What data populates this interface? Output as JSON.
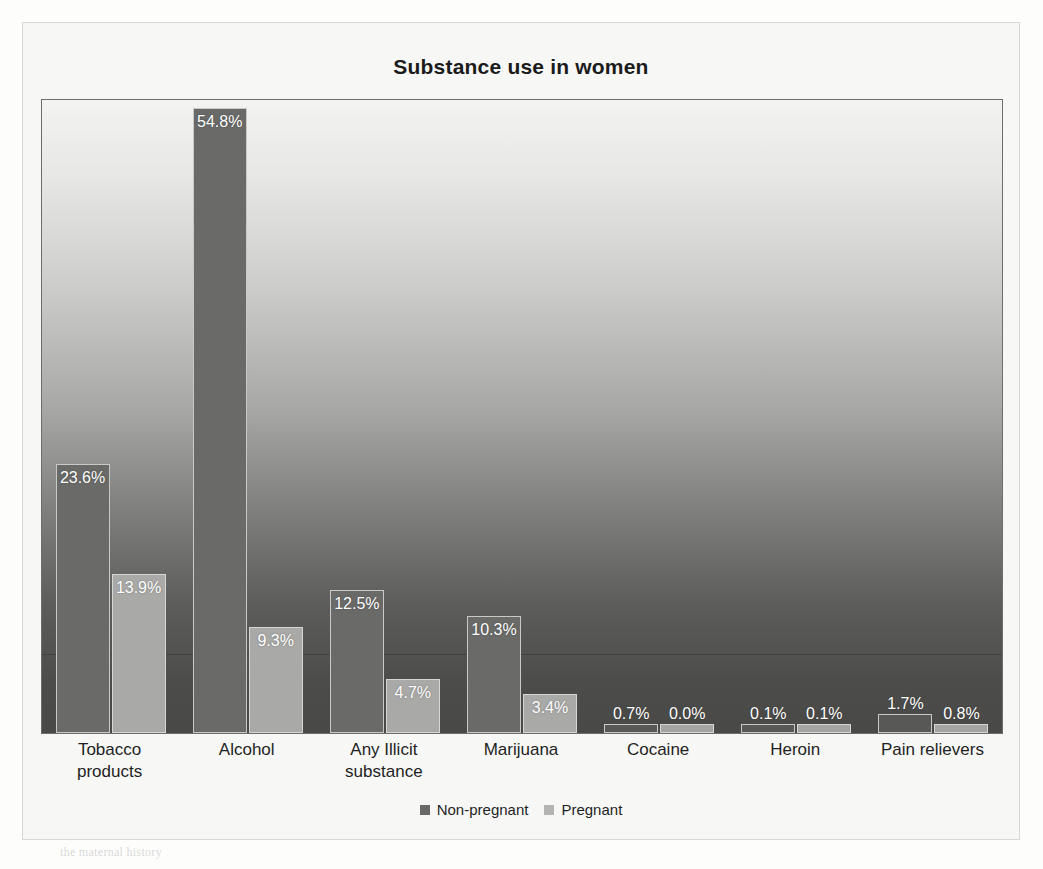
{
  "chart_data": {
    "type": "bar",
    "title": "Substance use in women",
    "xlabel": "",
    "ylabel": "",
    "ylim": [
      0,
      60
    ],
    "grid": true,
    "legend_position": "bottom",
    "value_suffix": "%",
    "categories": [
      "Tobacco products",
      "Alcohol",
      "Any Illicit substance",
      "Marijuana",
      "Cocaine",
      "Heroin",
      "Pain relievers"
    ],
    "category_lines": [
      [
        "Tobacco",
        "products"
      ],
      [
        "Alcohol"
      ],
      [
        "Any Illicit",
        "substance"
      ],
      [
        "Marijuana"
      ],
      [
        "Cocaine"
      ],
      [
        "Heroin"
      ],
      [
        "Pain relievers"
      ]
    ],
    "series": [
      {
        "name": "Non-pregnant",
        "color": "#6a6a69",
        "values": [
          23.6,
          54.8,
          12.5,
          10.3,
          0.7,
          0.1,
          1.7
        ],
        "labels": [
          "23.6%",
          "54.8%",
          "12.5%",
          "10.3%",
          "0.7%",
          "0.1%",
          "1.7%"
        ]
      },
      {
        "name": "Pregnant",
        "color": "#a9a9a7",
        "values": [
          13.9,
          9.3,
          4.7,
          3.4,
          0.0,
          0.1,
          0.8
        ],
        "labels": [
          "13.9%",
          "9.3%",
          "4.7%",
          "3.4%",
          "0.0%",
          "0.1%",
          "0.8%"
        ]
      }
    ]
  },
  "legend": {
    "items": [
      {
        "label": "Non-pregnant",
        "color": "#6a6a69"
      },
      {
        "label": "Pregnant",
        "color": "#b4b4b2"
      }
    ]
  },
  "page_background": {
    "ghost_lines": [
      "per the study",
      "Neonatal Withdrawal / Neonatal abstinence",
      "infants of the mothers abuse or report drug use",
      "withdrawal symptoms in the",
      "Use of the substance",
      "is confirmed by",
      "the maternal history"
    ]
  }
}
